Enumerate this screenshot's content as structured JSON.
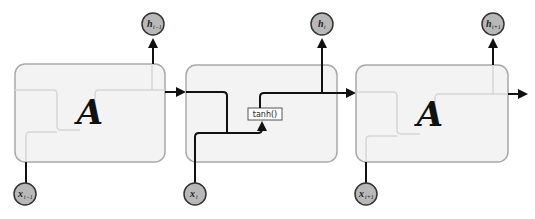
{
  "diagram": {
    "type": "unrolled-rnn",
    "colors": {
      "cell_fill": "#f2f2f2",
      "cell_stroke": "#a9a9a9",
      "ghost_line": "#d8d8d8",
      "active_line": "#111111",
      "node_fill": "#b8b8b8",
      "node_stroke": "#333333"
    },
    "cells": [
      {
        "id": "cell-prev",
        "label": "A",
        "input": {
          "label": "x",
          "sub": "t−1"
        },
        "output": {
          "label": "h",
          "sub": "t−1"
        }
      },
      {
        "id": "cell-current",
        "label": "",
        "activation": "tanh()",
        "input": {
          "label": "x",
          "sub": "t"
        },
        "output": {
          "label": "h",
          "sub": "t"
        }
      },
      {
        "id": "cell-next",
        "label": "A",
        "input": {
          "label": "x",
          "sub": "t+1"
        },
        "output": {
          "label": "h",
          "sub": "t+1"
        }
      }
    ]
  }
}
